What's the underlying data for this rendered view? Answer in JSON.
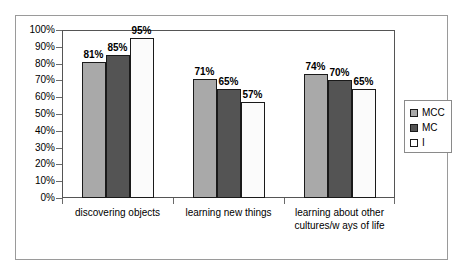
{
  "chart_data": {
    "type": "bar",
    "title": "",
    "xlabel": "",
    "ylabel": "",
    "ylim": [
      0,
      100
    ],
    "ytick_labels": [
      "100%",
      "90%",
      "80%",
      "70%",
      "60%",
      "50%",
      "40%",
      "30%",
      "20%",
      "10%",
      "0%"
    ],
    "ytick_values": [
      100,
      90,
      80,
      70,
      60,
      50,
      40,
      30,
      20,
      10,
      0
    ],
    "grid": false,
    "legend_position": "right",
    "categories": [
      "discovering objects",
      "learning new  things",
      "learning about other cultures/w ays of life"
    ],
    "category_lines": [
      [
        "discovering objects"
      ],
      [
        "learning new  things"
      ],
      [
        "learning about other",
        "cultures/w ays of life"
      ]
    ],
    "series": [
      {
        "name": "MCC",
        "color": "#a9a9a9",
        "values": [
          81,
          71,
          74
        ],
        "labels": [
          "81%",
          "71%",
          "74%"
        ]
      },
      {
        "name": "MC",
        "color": "#545454",
        "values": [
          85,
          65,
          70
        ],
        "labels": [
          "85%",
          "65%",
          "70%"
        ]
      },
      {
        "name": "I",
        "color": "#ffffff",
        "values": [
          95,
          57,
          65
        ],
        "labels": [
          "95%",
          "57%",
          "65%"
        ]
      }
    ]
  },
  "legend": {
    "items": [
      {
        "label": "MCC",
        "swatch": "s-mcc"
      },
      {
        "label": "MC",
        "swatch": "s-mc"
      },
      {
        "label": "I",
        "swatch": "s-i"
      }
    ]
  }
}
